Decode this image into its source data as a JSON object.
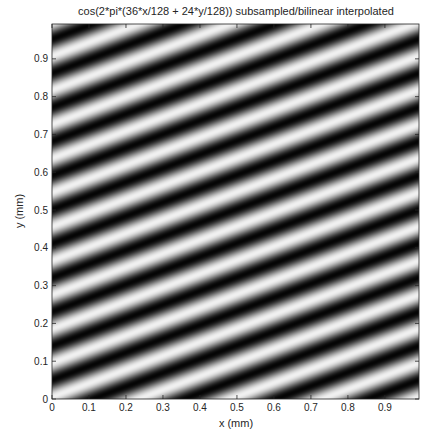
{
  "chart_data": {
    "type": "heatmap",
    "title": "cos(2*pi*(36*x/128 + 24*y/128)) subsampled/bilinear interpolated",
    "xlabel": "x (mm)",
    "ylabel": "y (mm)",
    "xlim": [
      0,
      0.9922
    ],
    "ylim": [
      0,
      0.9922
    ],
    "xticks": [
      0,
      0.1,
      0.2,
      0.3,
      0.4,
      0.5,
      0.6,
      0.7,
      0.8,
      0.9
    ],
    "yticks": [
      0,
      0.1,
      0.2,
      0.3,
      0.4,
      0.5,
      0.6,
      0.7,
      0.8,
      0.9
    ],
    "xtick_labels": [
      "0",
      "0.1",
      "0.2",
      "0.3",
      "0.4",
      "0.5",
      "0.6",
      "0.7",
      "0.8",
      "0.9"
    ],
    "ytick_labels": [
      "0",
      "0.1",
      "0.2",
      "0.3",
      "0.4",
      "0.5",
      "0.6",
      "0.7",
      "0.8",
      "0.9"
    ],
    "colormap": "gray",
    "pattern": {
      "function": "cos",
      "apparent_cycles_x": 4,
      "apparent_cycles_y": -11,
      "value_range": [
        -1,
        1
      ]
    },
    "grid": false
  }
}
